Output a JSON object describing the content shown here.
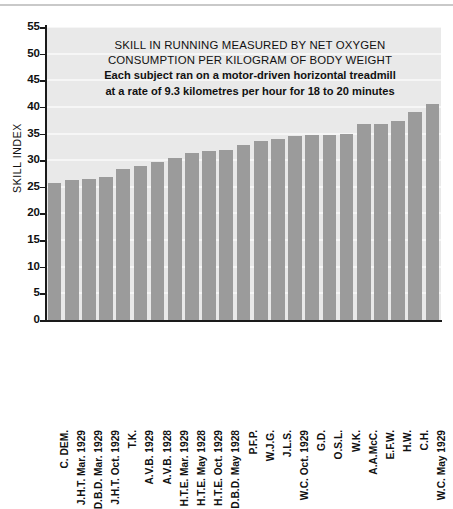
{
  "chart_data": {
    "type": "bar",
    "title": "SKILL IN RUNNING MEASURED BY NET OXYGEN CONSUMPTION PER KILOGRAM OF BODY WEIGHT",
    "title_lines": [
      "SKILL IN RUNNING MEASURED BY NET OXYGEN",
      "CONSUMPTION PER KILOGRAM OF BODY WEIGHT"
    ],
    "subtitle_lines": [
      "Each subject ran on a motor-driven horizontal treadmill",
      "at a rate of 9.3 kilometres per hour for 18 to 20 minutes"
    ],
    "xlabel": "",
    "ylabel": "SKILL INDEX",
    "ylim": [
      0,
      55
    ],
    "ytick_step": 5,
    "yticks": [
      0,
      5,
      10,
      15,
      20,
      25,
      30,
      35,
      40,
      45,
      50,
      55
    ],
    "grid": true,
    "grid_color": "#f6f6f6",
    "plot_background": "#e9e9e9",
    "bar_color": "#9b9b9b",
    "legend": null,
    "categories": [
      "C. DEM.",
      "J.H.T. Mar. 1929",
      "D.B.D. Mar. 1929",
      "J.H.T. Oct. 1929",
      "T.K.",
      "A.V.B. 1929",
      "A.V.B. 1928",
      "H.T.E. Mar. 1929",
      "H.T.E. May 1928",
      "H.T.E. Oct. 1929",
      "D.B.D. May 1928",
      "P.F.P.",
      "W.J.G.",
      "J.L.S.",
      "W.C. Oct. 1929",
      "G.D.",
      "O.S.L.",
      "W.K.",
      "A.A.McC.",
      "E.F.W.",
      "H.W.",
      "C.H.",
      "W.C. May 1929"
    ],
    "values": [
      25.8,
      26.3,
      26.4,
      26.8,
      28.3,
      29.0,
      29.7,
      30.5,
      31.4,
      31.8,
      32.0,
      32.8,
      33.6,
      34.0,
      34.6,
      34.8,
      34.8,
      35.0,
      36.8,
      36.8,
      37.4,
      39.0,
      40.5
    ]
  }
}
